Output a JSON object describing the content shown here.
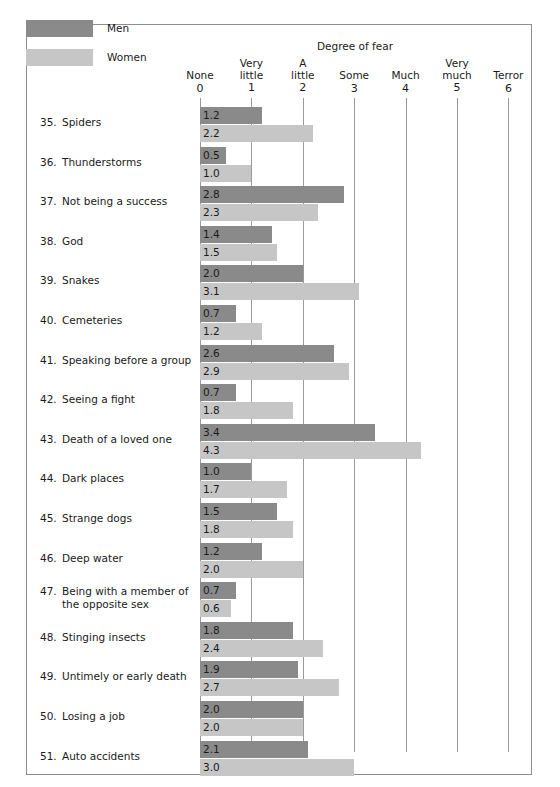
{
  "legend": {
    "men": {
      "label": "Men",
      "color": "#8a8a8a"
    },
    "women": {
      "label": "Women",
      "color": "#c6c6c6"
    }
  },
  "axis": {
    "title": "Degree of fear",
    "ticks": [
      {
        "word": "None",
        "num": "0"
      },
      {
        "word": "Very\nlittle",
        "num": "1"
      },
      {
        "word": "A\nlittle",
        "num": "2"
      },
      {
        "word": "Some",
        "num": "3"
      },
      {
        "word": "Much",
        "num": "4"
      },
      {
        "word": "Very\nmuch",
        "num": "5"
      },
      {
        "word": "Terror",
        "num": "6"
      }
    ]
  },
  "chart_data": {
    "type": "bar",
    "orientation": "horizontal",
    "title": "Degree of fear",
    "xlabel": "",
    "ylabel": "",
    "xlim": [
      0,
      6
    ],
    "grid": true,
    "legend_position": "top-left",
    "xtick_values": [
      0,
      1,
      2,
      3,
      4,
      5,
      6
    ],
    "xtick_labels": [
      "None 0",
      "Very little 1",
      "A little 2",
      "Some 3",
      "Much 4",
      "Very much 5",
      "Terror 6"
    ],
    "categories": [
      "35. Spiders",
      "36. Thunderstorms",
      "37. Not being a success",
      "38. God",
      "39. Snakes",
      "40. Cemeteries",
      "41. Speaking before a group",
      "42. Seeing a fight",
      "43. Death of a loved one",
      "44. Dark places",
      "45. Strange dogs",
      "46. Deep water",
      "47. Being with a member of the opposite sex",
      "48. Stinging insects",
      "49. Untimely or early death",
      "50. Losing a job",
      "51. Auto accidents"
    ],
    "series": [
      {
        "name": "Men",
        "color": "#8a8a8a",
        "values": [
          1.2,
          0.5,
          2.8,
          1.4,
          2.0,
          0.7,
          2.6,
          0.7,
          3.4,
          1.0,
          1.5,
          1.2,
          0.7,
          1.8,
          1.9,
          2.0,
          2.1
        ]
      },
      {
        "name": "Women",
        "color": "#c6c6c6",
        "values": [
          2.2,
          1.0,
          2.3,
          1.5,
          3.1,
          1.2,
          2.9,
          1.8,
          4.3,
          1.7,
          1.8,
          2.0,
          0.6,
          2.4,
          2.7,
          2.0,
          3.0
        ]
      }
    ]
  },
  "rows": [
    {
      "num": "35.",
      "text": "Spiders",
      "men": "1.2",
      "women": "2.2"
    },
    {
      "num": "36.",
      "text": "Thunderstorms",
      "men": "0.5",
      "women": "1.0"
    },
    {
      "num": "37.",
      "text": "Not being a success",
      "men": "2.8",
      "women": "2.3"
    },
    {
      "num": "38.",
      "text": "God",
      "men": "1.4",
      "women": "1.5"
    },
    {
      "num": "39.",
      "text": "Snakes",
      "men": "2.0",
      "women": "3.1"
    },
    {
      "num": "40.",
      "text": "Cemeteries",
      "men": "0.7",
      "women": "1.2"
    },
    {
      "num": "41.",
      "text": "Speaking before a group",
      "men": "2.6",
      "women": "2.9"
    },
    {
      "num": "42.",
      "text": "Seeing a fight",
      "men": "0.7",
      "women": "1.8"
    },
    {
      "num": "43.",
      "text": "Death of a loved one",
      "men": "3.4",
      "women": "4.3"
    },
    {
      "num": "44.",
      "text": "Dark places",
      "men": "1.0",
      "women": "1.7"
    },
    {
      "num": "45.",
      "text": "Strange dogs",
      "men": "1.5",
      "women": "1.8"
    },
    {
      "num": "46.",
      "text": "Deep water",
      "men": "1.2",
      "women": "2.0"
    },
    {
      "num": "47.",
      "text": "Being with a member of the opposite sex",
      "men": "0.7",
      "women": "0.6"
    },
    {
      "num": "48.",
      "text": "Stinging insects",
      "men": "1.8",
      "women": "2.4"
    },
    {
      "num": "49.",
      "text": "Untimely or early death",
      "men": "1.9",
      "women": "2.7"
    },
    {
      "num": "50.",
      "text": "Losing a job",
      "men": "2.0",
      "women": "2.0"
    },
    {
      "num": "51.",
      "text": "Auto accidents",
      "men": "2.1",
      "women": "3.0"
    }
  ],
  "geometry": {
    "origin_x": 200,
    "unit_px": 51.4,
    "row_top_first": 107,
    "row_pitch": 39.6,
    "bar_height": 17
  }
}
